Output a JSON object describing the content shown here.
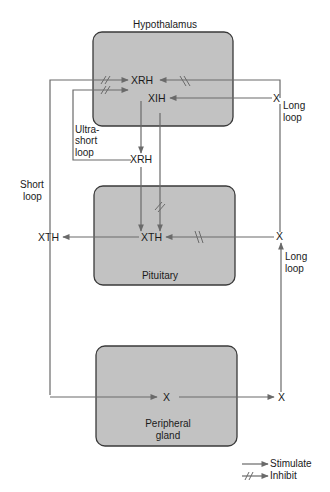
{
  "diagram": {
    "organs": {
      "hypothalamus": "Hypothalamus",
      "pituitary": "Pituitary",
      "peripheral_line1": "Peripheral",
      "peripheral_line2": "gland"
    },
    "nodes": {
      "xrh": "XRH",
      "xih": "XIH",
      "xrh_out": "XRH",
      "xth": "XTH",
      "xth_out": "XTH",
      "x_gland": "X",
      "x_right_bottom": "X",
      "x_right_mid": "X",
      "x_right_top": "X"
    },
    "loops": {
      "ultra_short_1": "Ultra-",
      "ultra_short_2": "short",
      "ultra_short_3": "loop",
      "short_1": "Short",
      "short_2": "loop",
      "long_top_1": "Long",
      "long_top_2": "loop",
      "long_mid_1": "Long",
      "long_mid_2": "loop"
    },
    "legend": {
      "stimulate": "Stimulate",
      "inhibit": "Inhibit"
    },
    "colors": {
      "box_fill": "#c2c2c2",
      "box_stroke": "#3a3a3a",
      "line": "#6a6a6a"
    }
  }
}
